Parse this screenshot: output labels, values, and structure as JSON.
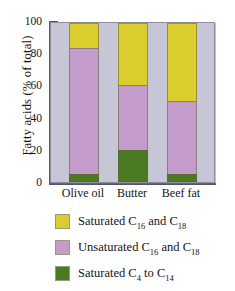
{
  "chart_data": {
    "type": "bar",
    "subtype": "stacked-bar-100",
    "title": "",
    "xlabel": "",
    "ylabel": "Fatty acids (% of total)",
    "ylim": [
      0,
      100
    ],
    "ytick_labels": [
      "0",
      "20",
      "40",
      "60",
      "80",
      "100"
    ],
    "ytick_values": [
      0,
      20,
      40,
      60,
      80,
      100
    ],
    "yminor_values": [
      10,
      30,
      50,
      70,
      90
    ],
    "grid": false,
    "legend_position": "below",
    "categories": [
      "Olive oil",
      "Butter",
      "Beef fat"
    ],
    "series": [
      {
        "name": "Saturated C4 to C14",
        "legend_label": "Saturated C",
        "legend_sub1": "4",
        "legend_mid": " to C",
        "legend_sub2": "14",
        "color": "#4a7a22",
        "values": [
          5,
          20,
          5
        ]
      },
      {
        "name": "Unsaturated C16 and C18",
        "legend_label": "Unsaturated C",
        "legend_sub1": "16",
        "legend_mid": " and C",
        "legend_sub2": "18",
        "color": "#c49ccc",
        "values": [
          79,
          41,
          46
        ]
      },
      {
        "name": "Saturated C16 and C18",
        "legend_label": "Saturated C",
        "legend_sub1": "16",
        "legend_mid": " and C",
        "legend_sub2": "18",
        "color": "#dccd2e",
        "values": [
          16,
          39,
          49
        ]
      }
    ],
    "cumulative_tops": {
      "Olive oil": [
        5,
        84,
        100
      ],
      "Butter": [
        20,
        61,
        100
      ],
      "Beef fat": [
        5,
        51,
        100
      ]
    },
    "plot_background": "#c6c6d6",
    "axis_color": "#555564"
  },
  "legend": {
    "rows": [
      {
        "swatch_name": "legend-swatch-saturated-c16-c18",
        "color": "#dccd2e",
        "label": "Saturated C",
        "sub1": "16",
        "mid": " and C",
        "sub2": "18"
      },
      {
        "swatch_name": "legend-swatch-unsaturated-c16-c18",
        "color": "#c49ccc",
        "label": "Unsaturated C",
        "sub1": "16",
        "mid": " and C",
        "sub2": "18"
      },
      {
        "swatch_name": "legend-swatch-saturated-c4-c14",
        "color": "#4a7a22",
        "label": "Saturated C",
        "sub1": "4",
        "mid": " to C",
        "sub2": "14"
      }
    ]
  }
}
